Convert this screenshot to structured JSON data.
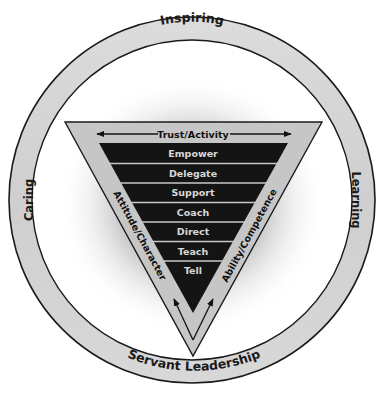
{
  "diagram": {
    "title": "Servant Leadership",
    "ring": {
      "top_label": "Inspiring",
      "left_label": "Caring",
      "right_label": "Learning",
      "bottom_label": "Servant Leadership"
    },
    "triangle": {
      "header_label": "Trust/Activity",
      "left_side_label": "Attitude/Character",
      "right_side_label": "Ability/Competence",
      "rows": [
        {
          "label": "Empower"
        },
        {
          "label": "Delegate"
        },
        {
          "label": "Support"
        },
        {
          "label": "Coach"
        },
        {
          "label": "Direct"
        },
        {
          "label": "Teach"
        },
        {
          "label": "Tell"
        }
      ]
    },
    "colors": {
      "ring_fill": "#d4d4d4",
      "ring_stroke": "#1a1a1a",
      "triangle_fill": "#c4c4c4",
      "dark_fill": "#141414",
      "row_text": "#d8d8d8",
      "glow": "#9a9a9a"
    }
  }
}
